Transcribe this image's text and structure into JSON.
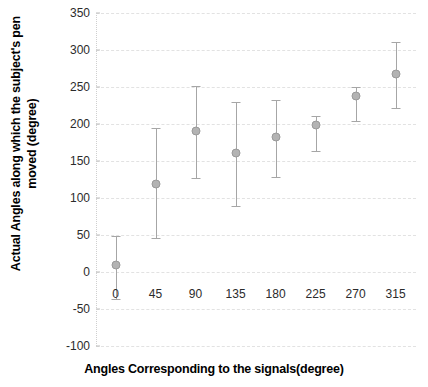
{
  "chart_data": {
    "type": "scatter",
    "title": "",
    "xlabel": "Angles Corresponding to the signals(degree)",
    "ylabel": "Actual Angles along which the subject's pen moved (degree)",
    "x": [
      0,
      45,
      90,
      135,
      180,
      225,
      270,
      315
    ],
    "xtick_labels": [
      "0",
      "45",
      "90",
      "135",
      "180",
      "225",
      "270",
      "315"
    ],
    "ytick_labels": [
      "350",
      "300",
      "250",
      "200",
      "150",
      "100",
      "50",
      "0",
      "-50",
      "-100"
    ],
    "ytick_values": [
      350,
      300,
      250,
      200,
      150,
      100,
      50,
      0,
      -50,
      -100
    ],
    "ylim": [
      -100,
      350
    ],
    "xlim": [
      -22,
      338
    ],
    "grid": true,
    "legend": "none",
    "series": [
      {
        "name": "Actual angle moved",
        "values": [
          10,
          119,
          191,
          161,
          183,
          199,
          238,
          267
        ],
        "error_upper": [
          48,
          194,
          252,
          230,
          232,
          211,
          250,
          311
        ],
        "error_lower": [
          -37,
          46,
          127,
          89,
          128,
          163,
          204,
          222
        ]
      }
    ]
  },
  "axes": {
    "y_title": "Actual Angles along which the subject's pen moved (degree)",
    "x_title": "Angles Corresponding to the signals(degree)"
  },
  "style": {
    "marker_color": "#b3b3b3",
    "errorbar_color": "#a6a6a6",
    "gridline_color": "#e2e2e2",
    "text_color": "#000000",
    "background": "#ffffff"
  }
}
